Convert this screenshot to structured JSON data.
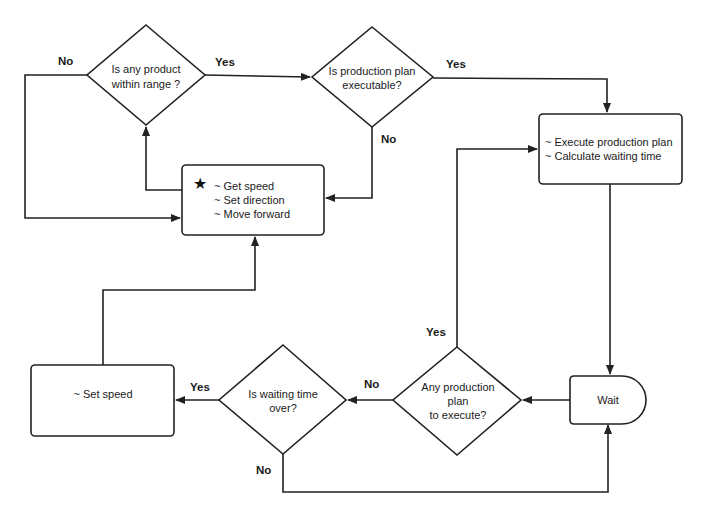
{
  "diagram": {
    "type": "flowchart",
    "colors": {
      "stroke": "#222222",
      "fill": "#ffffff",
      "text": "#1a1a1a"
    },
    "nodes": {
      "product_in_range": {
        "shape": "decision",
        "lines": [
          "Is any product",
          "within range ?"
        ]
      },
      "plan_executable": {
        "shape": "decision",
        "lines": [
          "Is production plan",
          "executable?"
        ]
      },
      "move": {
        "shape": "process",
        "icon": "star-icon",
        "icon_glyph": "★",
        "lines": [
          "~ Get speed",
          "~ Set direction",
          "~ Move forward"
        ]
      },
      "execute": {
        "shape": "process",
        "lines": [
          "~ Execute production plan",
          "~ Calculate waiting time"
        ]
      },
      "wait": {
        "shape": "delay",
        "lines": [
          "Wait"
        ]
      },
      "any_plan": {
        "shape": "decision",
        "lines": [
          "Any production",
          "plan",
          "to execute?"
        ]
      },
      "waiting_over": {
        "shape": "decision",
        "lines": [
          "Is waiting time",
          "over?"
        ]
      },
      "set_speed": {
        "shape": "process",
        "lines": [
          "~ Set speed"
        ]
      }
    },
    "edge_labels": {
      "range_no": "No",
      "range_yes": "Yes",
      "exec_yes": "Yes",
      "exec_no": "No",
      "any_yes": "Yes",
      "any_no": "No",
      "wait_yes": "Yes",
      "wait_no": "No"
    },
    "edges": [
      {
        "from": "product_in_range",
        "to": "plan_executable",
        "label": "Yes"
      },
      {
        "from": "product_in_range",
        "to": "move",
        "label": "No"
      },
      {
        "from": "plan_executable",
        "to": "execute",
        "label": "Yes"
      },
      {
        "from": "plan_executable",
        "to": "move",
        "label": "No"
      },
      {
        "from": "move",
        "to": "product_in_range",
        "label": ""
      },
      {
        "from": "execute",
        "to": "wait",
        "label": ""
      },
      {
        "from": "wait",
        "to": "any_plan",
        "label": ""
      },
      {
        "from": "any_plan",
        "to": "execute",
        "label": "Yes"
      },
      {
        "from": "any_plan",
        "to": "waiting_over",
        "label": "No"
      },
      {
        "from": "waiting_over",
        "to": "set_speed",
        "label": "Yes"
      },
      {
        "from": "waiting_over",
        "to": "wait",
        "label": "No"
      },
      {
        "from": "set_speed",
        "to": "move",
        "label": ""
      }
    ]
  }
}
